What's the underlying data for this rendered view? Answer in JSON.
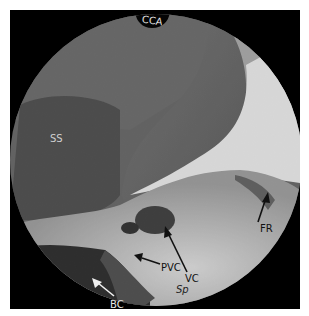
{
  "figure": {
    "colors": {
      "background": "#ffffff",
      "frame": "#000000",
      "dark_tissue": "#3a3a3a",
      "mid_tissue": "#5c5c5c",
      "light_tissue": "#a8a8a8",
      "bright_region": "#f4f4f4"
    }
  },
  "labels": {
    "cca": "CCA",
    "ss": "SS",
    "fr": "FR",
    "pvc": "PVC",
    "vc": "VC",
    "sp": "Sp",
    "bc": "BC"
  }
}
